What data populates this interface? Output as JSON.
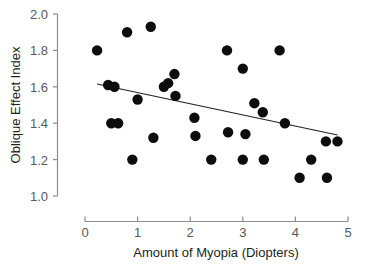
{
  "chart_data": {
    "type": "scatter",
    "title": "",
    "subtitle": "",
    "xlabel": "Amount of Myopia (Diopters)",
    "ylabel": "Oblique Effect Index",
    "xlim": [
      0,
      5
    ],
    "ylim": [
      1.0,
      2.0
    ],
    "xticks": [
      0,
      1,
      2,
      3,
      4,
      5
    ],
    "yticks": [
      1.0,
      1.2,
      1.4,
      1.6,
      1.8,
      2.0
    ],
    "xtick_labels": [
      "0",
      "1",
      "2",
      "3",
      "4",
      "5"
    ],
    "ytick_labels": [
      "1.0",
      "1.2",
      "1.4",
      "1.6",
      "1.8",
      "2.0"
    ],
    "grid": false,
    "legend": null,
    "legend_position": "none",
    "marker": "filled-circle",
    "marker_color": "#0d0d0d",
    "marker_size_px": 5.2,
    "points": [
      {
        "x": 0.23,
        "y": 1.8
      },
      {
        "x": 0.44,
        "y": 1.61
      },
      {
        "x": 0.5,
        "y": 1.4
      },
      {
        "x": 0.56,
        "y": 1.6
      },
      {
        "x": 0.63,
        "y": 1.4
      },
      {
        "x": 0.8,
        "y": 1.9
      },
      {
        "x": 0.9,
        "y": 1.2
      },
      {
        "x": 1.0,
        "y": 1.53
      },
      {
        "x": 1.25,
        "y": 1.93
      },
      {
        "x": 1.3,
        "y": 1.32
      },
      {
        "x": 1.5,
        "y": 1.6
      },
      {
        "x": 1.58,
        "y": 1.62
      },
      {
        "x": 1.7,
        "y": 1.67
      },
      {
        "x": 1.72,
        "y": 1.55
      },
      {
        "x": 2.08,
        "y": 1.43
      },
      {
        "x": 2.1,
        "y": 1.33
      },
      {
        "x": 2.4,
        "y": 1.2
      },
      {
        "x": 2.7,
        "y": 1.8
      },
      {
        "x": 2.72,
        "y": 1.35
      },
      {
        "x": 3.0,
        "y": 1.7
      },
      {
        "x": 3.0,
        "y": 1.2
      },
      {
        "x": 3.05,
        "y": 1.34
      },
      {
        "x": 3.22,
        "y": 1.51
      },
      {
        "x": 3.38,
        "y": 1.46
      },
      {
        "x": 3.4,
        "y": 1.2
      },
      {
        "x": 3.7,
        "y": 1.8
      },
      {
        "x": 3.8,
        "y": 1.4
      },
      {
        "x": 4.08,
        "y": 1.1
      },
      {
        "x": 4.3,
        "y": 1.2
      },
      {
        "x": 4.58,
        "y": 1.3
      },
      {
        "x": 4.6,
        "y": 1.1
      },
      {
        "x": 4.8,
        "y": 1.3
      }
    ],
    "trend_line": {
      "type": "linear-fit",
      "x_start": 0.23,
      "y_start": 1.615,
      "x_end": 4.8,
      "y_end": 1.335,
      "slope": -0.0613,
      "intercept": 1.629
    }
  },
  "axes": {
    "x_axis_name": "x-axis",
    "y_axis_name": "y-axis"
  }
}
